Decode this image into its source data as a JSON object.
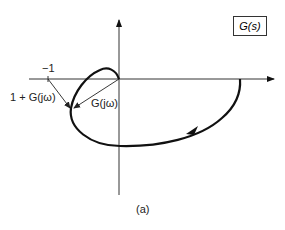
{
  "diagram": {
    "title_box": "G(s)",
    "point_label": "−1",
    "vector_labels": {
      "sum": "1 + G(jω)",
      "g": "G(jω)"
    },
    "caption": "(a)",
    "colors": {
      "stroke": "#111111",
      "axis": "#333333"
    }
  }
}
